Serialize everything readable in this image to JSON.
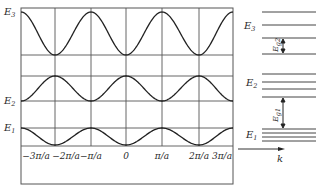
{
  "diagram": {
    "bands": [
      {
        "name": "E1",
        "label": "E",
        "sub": "1",
        "shape": "cos",
        "phase": "max-at-zero-boundary"
      },
      {
        "name": "E2",
        "label": "E",
        "sub": "2",
        "shape": "cos",
        "phase": "min-at-odd"
      },
      {
        "name": "E3",
        "label": "E",
        "sub": "3",
        "shape": "cos",
        "phase": "max-at-even-boundary"
      }
    ],
    "x_ticks": [
      "−3π/a",
      "−2π/a",
      "−π/a",
      "0",
      "π/a",
      "2π/a",
      "3π/a"
    ],
    "x_tick_values": [
      -3,
      -2,
      -1,
      0,
      1,
      2,
      3
    ],
    "right_panel": {
      "band_labels": [
        {
          "label": "E",
          "sub": "3"
        },
        {
          "label": "E",
          "sub": "2"
        },
        {
          "label": "E",
          "sub": "1"
        }
      ],
      "gap_labels": [
        {
          "label": "E",
          "sub": "g2"
        },
        {
          "label": "E",
          "sub": "g1"
        }
      ],
      "axis_label": "k"
    },
    "colors": {
      "line": "#2a2a2a",
      "grid": "#555555"
    }
  }
}
